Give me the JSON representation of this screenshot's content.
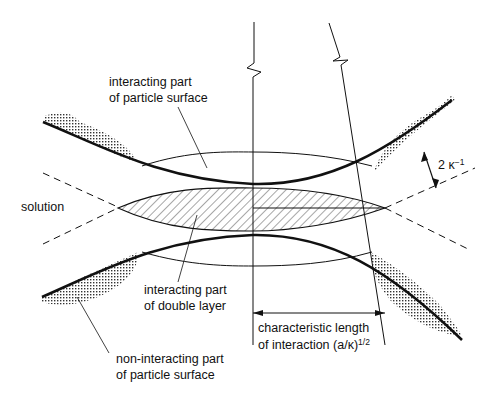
{
  "diagram": {
    "type": "double-layer interaction between two curved particle surfaces",
    "labels": {
      "interacting_surface_line1": "interacting part",
      "interacting_surface_line2": "of particle surface",
      "solution": "solution",
      "double_layer_line1": "interacting part",
      "double_layer_line2": "of double layer",
      "non_interacting_line1": "non-interacting part",
      "non_interacting_line2": "of particle surface",
      "char_length_line1": "characteristic length",
      "char_length_line2_prefix": "of interaction (a/κ)",
      "char_length_exponent": "1/2",
      "debye_thickness": "2 κ",
      "debye_exponent": "−1"
    },
    "colors": {
      "line": "#111111",
      "stipple": "#555555",
      "background": "#ffffff"
    }
  }
}
